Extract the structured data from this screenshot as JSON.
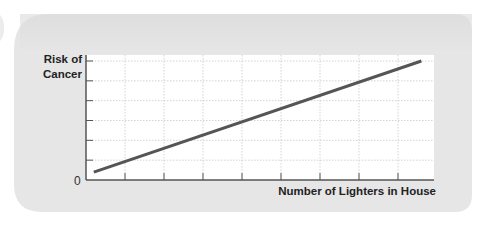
{
  "chart_data": {
    "type": "line",
    "title": "",
    "ylabel": "Risk of Cancer",
    "ylabel_lines": [
      "Risk of",
      "Cancer"
    ],
    "xlabel": "Number of Lighters in House",
    "origin_label": "0",
    "xlim": [
      0,
      9.2
    ],
    "ylim": [
      0,
      6
    ],
    "x_ticks": [
      1,
      2,
      3,
      4,
      5,
      6,
      7,
      8
    ],
    "y_ticks": [
      1,
      2,
      3,
      4,
      5,
      6
    ],
    "x_tick_labels": [],
    "y_tick_labels": [],
    "grid": true,
    "legend": "none",
    "series": [
      {
        "name": "Risk of Cancer",
        "x": [
          0.2,
          8.6
        ],
        "y": [
          0.4,
          6.0
        ],
        "color": "#555555"
      }
    ]
  },
  "colors": {
    "panel_background": "#e6e6e6",
    "plot_background": "#ffffff",
    "grid": "#c8c8c8",
    "axis": "#555555",
    "line": "#555555"
  }
}
